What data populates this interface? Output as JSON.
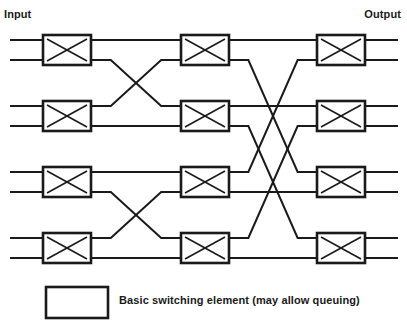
{
  "header": {
    "input_label": "Input",
    "output_label": "Output"
  },
  "legend": {
    "text": "Basic switching element (may allow queuing)",
    "swatch_name": "basic-switching-element"
  },
  "style": {
    "line_color": "#1a1a1a",
    "box_fill": "#ffffff",
    "background": "#ffffff",
    "line_width": 2.0,
    "box_stroke_width": 2.6,
    "cross_stroke_width": 1.6
  },
  "chart_data": {
    "type": "diagram",
    "stages": 3,
    "switch_rows": 4,
    "ports_per_switch": 2,
    "total_lines": 8,
    "line_y": [
      40,
      60,
      106,
      126,
      172,
      192,
      238,
      258
    ],
    "stage_x": [
      {
        "name": "stage-1",
        "left": 43,
        "right": 91
      },
      {
        "name": "stage-2",
        "left": 181,
        "right": 229
      },
      {
        "name": "stage-3",
        "left": 317,
        "right": 365
      }
    ],
    "box_height": 30,
    "box_tops": [
      35,
      101,
      167,
      233
    ],
    "edge_left": 10,
    "edge_right": 398,
    "switches": [
      {
        "id": "sw-1-1",
        "stage": 1,
        "row": 1,
        "x": 43,
        "y": 35,
        "w": 48,
        "h": 30
      },
      {
        "id": "sw-1-2",
        "stage": 1,
        "row": 2,
        "x": 43,
        "y": 101,
        "w": 48,
        "h": 30
      },
      {
        "id": "sw-1-3",
        "stage": 1,
        "row": 3,
        "x": 43,
        "y": 167,
        "w": 48,
        "h": 30
      },
      {
        "id": "sw-1-4",
        "stage": 1,
        "row": 4,
        "x": 43,
        "y": 233,
        "w": 48,
        "h": 30
      },
      {
        "id": "sw-2-1",
        "stage": 2,
        "row": 1,
        "x": 181,
        "y": 35,
        "w": 48,
        "h": 30
      },
      {
        "id": "sw-2-2",
        "stage": 2,
        "row": 2,
        "x": 181,
        "y": 101,
        "w": 48,
        "h": 30
      },
      {
        "id": "sw-2-3",
        "stage": 2,
        "row": 3,
        "x": 181,
        "y": 167,
        "w": 48,
        "h": 30
      },
      {
        "id": "sw-2-4",
        "stage": 2,
        "row": 4,
        "x": 181,
        "y": 233,
        "w": 48,
        "h": 30
      },
      {
        "id": "sw-3-1",
        "stage": 3,
        "row": 1,
        "x": 317,
        "y": 35,
        "w": 48,
        "h": 30
      },
      {
        "id": "sw-3-2",
        "stage": 3,
        "row": 2,
        "x": 317,
        "y": 101,
        "w": 48,
        "h": 30
      },
      {
        "id": "sw-3-3",
        "stage": 3,
        "row": 3,
        "x": 317,
        "y": 167,
        "w": 48,
        "h": 30
      },
      {
        "id": "sw-3-4",
        "stage": 3,
        "row": 4,
        "x": 317,
        "y": 233,
        "w": 48,
        "h": 30
      }
    ],
    "input_stubs": [
      {
        "name": "input-line-1",
        "y": 40
      },
      {
        "name": "input-line-2",
        "y": 60
      },
      {
        "name": "input-line-3",
        "y": 106
      },
      {
        "name": "input-line-4",
        "y": 126
      },
      {
        "name": "input-line-5",
        "y": 172
      },
      {
        "name": "input-line-6",
        "y": 192
      },
      {
        "name": "input-line-7",
        "y": 238
      },
      {
        "name": "input-line-8",
        "y": 258
      }
    ],
    "output_stubs": [
      {
        "name": "output-line-1",
        "y": 40
      },
      {
        "name": "output-line-2",
        "y": 60
      },
      {
        "name": "output-line-3",
        "y": 106
      },
      {
        "name": "output-line-4",
        "y": 126
      },
      {
        "name": "output-line-5",
        "y": 172
      },
      {
        "name": "output-line-6",
        "y": 192
      },
      {
        "name": "output-line-7",
        "y": 238
      },
      {
        "name": "output-line-8",
        "y": 258
      }
    ],
    "links_stage1_to_stage2": [
      {
        "name": "link-s1-1",
        "from_row": 1,
        "from_port": "top",
        "y1": 40,
        "y2": 40,
        "type": "straight"
      },
      {
        "name": "link-s1-2",
        "from_row": 1,
        "from_port": "bottom",
        "y1": 60,
        "y2": 106,
        "type": "cross-down"
      },
      {
        "name": "link-s1-3",
        "from_row": 2,
        "from_port": "top",
        "y1": 106,
        "y2": 60,
        "type": "cross-up"
      },
      {
        "name": "link-s1-4",
        "from_row": 2,
        "from_port": "bottom",
        "y1": 126,
        "y2": 126,
        "type": "straight"
      },
      {
        "name": "link-s1-5",
        "from_row": 3,
        "from_port": "top",
        "y1": 172,
        "y2": 172,
        "type": "straight"
      },
      {
        "name": "link-s1-6",
        "from_row": 3,
        "from_port": "bottom",
        "y1": 192,
        "y2": 238,
        "type": "cross-down"
      },
      {
        "name": "link-s1-7",
        "from_row": 4,
        "from_port": "top",
        "y1": 238,
        "y2": 192,
        "type": "cross-up"
      },
      {
        "name": "link-s1-8",
        "from_row": 4,
        "from_port": "bottom",
        "y1": 258,
        "y2": 258,
        "type": "straight"
      }
    ],
    "links_stage2_to_stage3": [
      {
        "name": "link-s2-1",
        "from_row": 1,
        "from_port": "top",
        "y1": 40,
        "y2": 40,
        "type": "straight"
      },
      {
        "name": "link-s2-2",
        "from_row": 1,
        "from_port": "bottom",
        "y1": 60,
        "y2": 172,
        "type": "cross-down"
      },
      {
        "name": "link-s2-3",
        "from_row": 2,
        "from_port": "top",
        "y1": 106,
        "y2": 106,
        "type": "straight"
      },
      {
        "name": "link-s2-4",
        "from_row": 2,
        "from_port": "bottom",
        "y1": 126,
        "y2": 238,
        "type": "cross-down"
      },
      {
        "name": "link-s2-5",
        "from_row": 3,
        "from_port": "top",
        "y1": 172,
        "y2": 60,
        "type": "cross-up"
      },
      {
        "name": "link-s2-6",
        "from_row": 3,
        "from_port": "bottom",
        "y1": 192,
        "y2": 192,
        "type": "straight"
      },
      {
        "name": "link-s2-7",
        "from_row": 4,
        "from_port": "top",
        "y1": 238,
        "y2": 126,
        "type": "cross-up"
      },
      {
        "name": "link-s2-8",
        "from_row": 4,
        "from_port": "bottom",
        "y1": 258,
        "y2": 258,
        "type": "straight"
      }
    ],
    "legend_swatch": {
      "x": 46,
      "y": 287,
      "w": 62,
      "h": 31
    }
  }
}
